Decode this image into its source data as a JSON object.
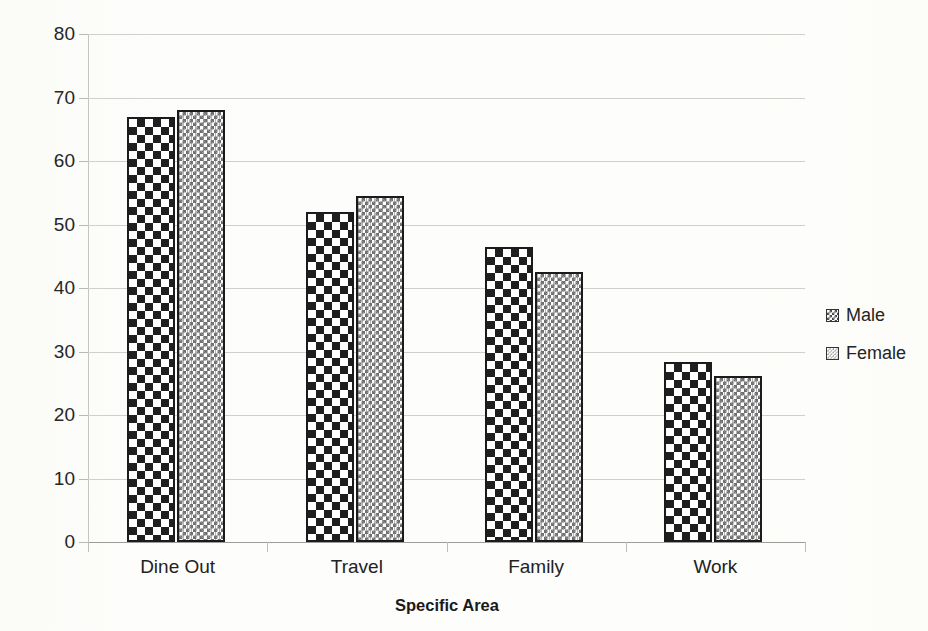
{
  "chart_data": {
    "type": "bar",
    "title": "",
    "xlabel": "Specific Area",
    "ylabel": "Percentage of Population Affected",
    "categories": [
      "Dine Out",
      "Travel",
      "Family",
      "Work"
    ],
    "series": [
      {
        "name": "Male",
        "values": [
          67,
          52,
          46.5,
          28.3
        ]
      },
      {
        "name": "Female",
        "values": [
          68,
          54.5,
          42.5,
          26.2
        ]
      }
    ],
    "ylim": [
      0,
      80
    ],
    "ytick_labels": [
      "0",
      "10",
      "20",
      "30",
      "40",
      "50",
      "60",
      "70",
      "80"
    ],
    "ytick_values": [
      0,
      10,
      20,
      30,
      40,
      50,
      60,
      70,
      80
    ],
    "grid": true,
    "legend_position": "right",
    "legend_entries": [
      "Male",
      "Female"
    ],
    "colors": {
      "male_pattern_fg": "#1f1f1f",
      "male_pattern_bg": "#ffffff",
      "female_pattern_fg": "#6f6f6f",
      "female_pattern_bg": "#ffffff",
      "bar_outline": "#1b1b1b",
      "gridline": "#cfcfcc",
      "axis_line": "#9c9c99",
      "text": "#1c1c1c",
      "background": "#fdfdfb"
    }
  }
}
